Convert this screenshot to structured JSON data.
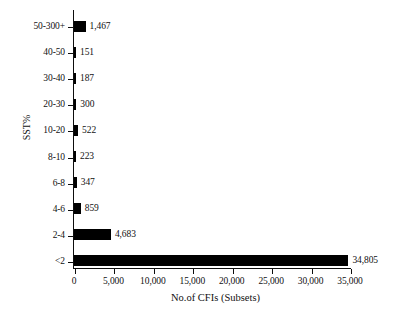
{
  "chart_data": {
    "type": "bar",
    "orientation": "horizontal",
    "title": "",
    "xlabel": "No.of CFIs (Subsets)",
    "ylabel": "SST%",
    "categories": [
      "50-300+",
      "40-50",
      "30-40",
      "20-30",
      "10-20",
      "8-10",
      "6-8",
      "4-6",
      "2-4",
      "<2"
    ],
    "values": [
      1467,
      151,
      187,
      300,
      522,
      223,
      347,
      859,
      4683,
      34805
    ],
    "value_labels": [
      "1,467",
      "151",
      "187",
      "300",
      "522",
      "223",
      "347",
      "859",
      "4,683",
      "34,805"
    ],
    "xlim": [
      0,
      35000
    ],
    "xticks": [
      0,
      5000,
      10000,
      15000,
      20000,
      25000,
      30000,
      35000
    ],
    "xtick_labels": [
      "0",
      "5,000",
      "10,000",
      "15,000",
      "20,000",
      "25,000",
      "30,000",
      "35,000"
    ],
    "grid": false,
    "legend": false,
    "bar_color": "#000000",
    "background_color": "#ffffff",
    "axis_color": "#0d0d0d"
  }
}
